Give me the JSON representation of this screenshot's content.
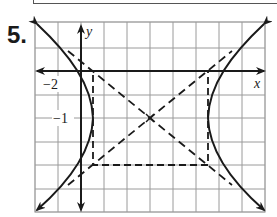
{
  "problem_number": "5.",
  "axes": {
    "x_label": "x",
    "y_label": "y",
    "tick_labels": [
      {
        "text": "−2",
        "axis": "x"
      },
      {
        "text": "−1",
        "axis": "y"
      }
    ]
  },
  "graph": {
    "type": "hyperbola",
    "orientation": "horizontal",
    "center": "(2, -1)",
    "fundamental_rectangle": "dashed",
    "asymptotes": "dashed",
    "grid": true
  },
  "colors": {
    "ink": "#1a1a1a",
    "grid": "#9a9a9a"
  }
}
